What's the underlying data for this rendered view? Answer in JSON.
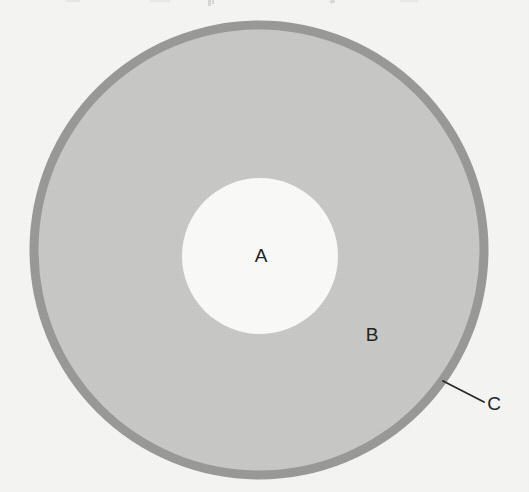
{
  "figure": {
    "background_color": "#f6f6f4",
    "labels": {
      "inner_region": "A",
      "middle_region": "B",
      "outer_rim": "C"
    },
    "colors": {
      "inner_circle_fill": "#fbfbfa",
      "middle_annulus_fill": "#c9c9c7",
      "outer_rim_fill": "#9a9a98",
      "label_text": "#242424",
      "leader_line": "#2b2b2b"
    },
    "geometry": {
      "outer_circle": {
        "cx": 259,
        "cy": 250,
        "r": 230
      },
      "rim_thickness": 9,
      "inner_circle": {
        "cx": 260,
        "cy": 256,
        "r": 78
      }
    },
    "label_positions": {
      "inner_region": {
        "x": 261,
        "y": 256
      },
      "middle_region": {
        "x": 372,
        "y": 335
      },
      "outer_rim": {
        "x": 494,
        "y": 404
      }
    },
    "leader_line": {
      "x1": 443,
      "y1": 381,
      "x2": 484,
      "y2": 402
    }
  }
}
